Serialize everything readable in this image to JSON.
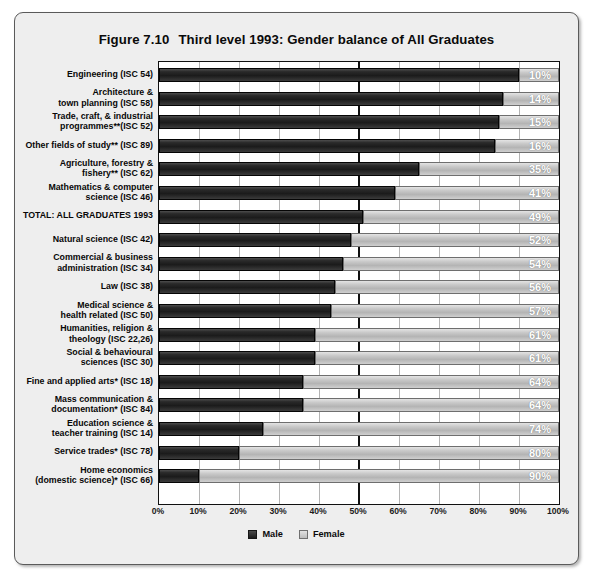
{
  "figure": {
    "number": "Figure 7.10",
    "title": "Third level 1993: Gender balance of All Graduates"
  },
  "legend": {
    "male_label": "Male",
    "female_label": "Female",
    "male_color": "#262626",
    "female_color": "#c6c6c6"
  },
  "axis": {
    "ticks": [
      "0%",
      "10%",
      "20%",
      "30%",
      "40%",
      "50%",
      "60%",
      "70%",
      "80%",
      "90%",
      "100%"
    ]
  },
  "chart_data": {
    "type": "bar",
    "orientation": "horizontal",
    "stacked": true,
    "title": "Third level 1993: Gender balance of All Graduates",
    "xlabel": "",
    "ylabel": "",
    "xlim": [
      0,
      100
    ],
    "grid": true,
    "legend_position": "bottom",
    "categories": [
      "Engineering (ISC 54)",
      "Architecture &\ntown planning (ISC 58)",
      "Trade, craft, & industrial\nprogrammes**(ISC 52)",
      "Other fields of study** (ISC 89)",
      "Agriculture, forestry &\nfishery** (ISC 62)",
      "Mathematics & computer\nscience (ISC 46)",
      "TOTAL: ALL GRADUATES 1993",
      "Natural science (ISC 42)",
      "Commercial & business\nadministration (ISC 34)",
      "Law (ISC 38)",
      "Medical science &\nhealth related (ISC 50)",
      "Humanities, religion &\ntheology (ISC 22,26)",
      "Social & behavioural\nsciences (ISC 30)",
      "Fine and applied arts* (ISC 18)",
      "Mass communication &\ndocumentation* (ISC 84)",
      "Education science &\nteacher training (ISC 14)",
      "Service trades* (ISC 78)",
      "Home economics\n(domestic science)* (ISC 66)"
    ],
    "series": [
      {
        "name": "Male",
        "values": [
          90,
          86,
          85,
          84,
          65,
          59,
          51,
          48,
          46,
          44,
          43,
          39,
          39,
          36,
          36,
          26,
          20,
          10
        ]
      },
      {
        "name": "Female",
        "values": [
          10,
          14,
          15,
          16,
          35,
          41,
          49,
          52,
          54,
          56,
          57,
          61,
          61,
          64,
          64,
          74,
          80,
          90
        ]
      }
    ],
    "data_labels": [
      "10%",
      "14%",
      "15%",
      "16%",
      "35%",
      "41%",
      "49%",
      "52%",
      "54%",
      "56%",
      "57%",
      "61%",
      "61%",
      "64%",
      "64%",
      "74%",
      "80%",
      "90%"
    ],
    "data_labels_series": "Female"
  }
}
